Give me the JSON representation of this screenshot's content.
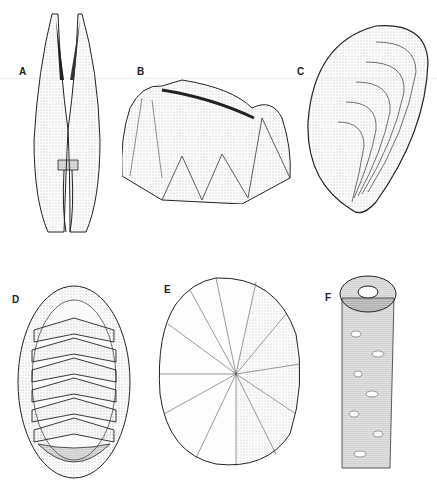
{
  "plate": {
    "type": "scientific-illustration",
    "style": "stippled pen-and-ink",
    "panels": [
      {
        "label": "A",
        "subject": "elongated bivalve shell, dorsal view with two narrow valves"
      },
      {
        "label": "B",
        "subject": "barnacle with ribbed conical wall plates"
      },
      {
        "label": "C",
        "subject": "mussel shell with concentric growth lines"
      },
      {
        "label": "D",
        "subject": "chiton with eight overlapping dorsal plates and girdle"
      },
      {
        "label": "E",
        "subject": "limpet shell with radial ribs"
      },
      {
        "label": "F",
        "subject": "tube worm with cemented sand-grain tube"
      }
    ],
    "caption": ""
  },
  "colors": {
    "ink": "#222222",
    "stipple": "#555555",
    "background": "#ffffff"
  }
}
